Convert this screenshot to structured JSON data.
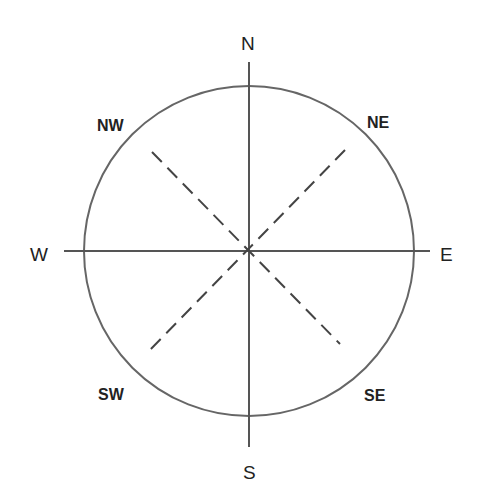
{
  "diagram": {
    "type": "compass-rose",
    "center": [
      249,
      251
    ],
    "radius": 165,
    "stroke_color": "#555555",
    "label_color": "#222222",
    "cardinal": {
      "north": "N",
      "east": "E",
      "south": "S",
      "west": "W"
    },
    "intercardinal": {
      "northeast": "NE",
      "northwest": "NW",
      "southeast": "SE",
      "southwest": "SW"
    }
  }
}
